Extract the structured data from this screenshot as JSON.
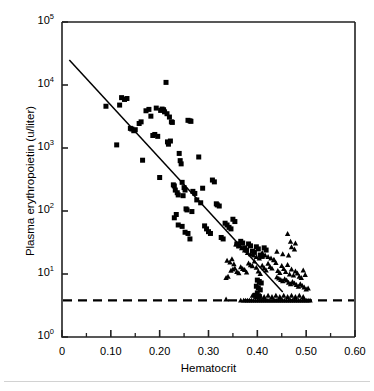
{
  "chart_data": {
    "type": "scatter",
    "title": "",
    "xlabel": "Hematocrit",
    "ylabel": "Plasma erythropoietin (u/liter)",
    "xlim": [
      0,
      0.6
    ],
    "ylim": [
      1,
      100000
    ],
    "yscale": "log",
    "xscale": "linear",
    "grid": false,
    "legend": "none",
    "x_major_ticks": [
      0,
      0.1,
      0.2,
      0.3,
      0.4,
      0.5,
      0.6
    ],
    "x_tick_labels": [
      "0",
      "0.10",
      "0.20",
      "0.30",
      "0.40",
      "0.50",
      "0.60"
    ],
    "x_minor_ticks": [
      0.05,
      0.15,
      0.25,
      0.35,
      0.45,
      0.55
    ],
    "y_major_ticks": [
      1,
      10,
      100,
      1000,
      10000,
      100000
    ],
    "y_tick_labels": [
      {
        "mantissa": "10",
        "exponent": "0"
      },
      {
        "mantissa": "10",
        "exponent": "1"
      },
      {
        "mantissa": "10",
        "exponent": "2"
      },
      {
        "mantissa": "10",
        "exponent": "3"
      },
      {
        "mantissa": "10",
        "exponent": "4"
      },
      {
        "mantissa": "10",
        "exponent": "5"
      }
    ],
    "annotations": [
      {
        "name": "detection-limit-line",
        "type": "hline",
        "y": 3.8,
        "style": "dashed"
      },
      {
        "name": "regression-line",
        "type": "line",
        "style": "solid",
        "x0": 0.015,
        "y0": 25000,
        "x1": 0.452,
        "y1": 5.2
      }
    ],
    "series": [
      {
        "name": "anemic-patients",
        "marker": "square",
        "color": "#000000",
        "points": [
          [
            0.09,
            4600
          ],
          [
            0.112,
            1120
          ],
          [
            0.118,
            4800
          ],
          [
            0.122,
            6300
          ],
          [
            0.128,
            5900
          ],
          [
            0.133,
            6100
          ],
          [
            0.14,
            2050
          ],
          [
            0.143,
            2000
          ],
          [
            0.147,
            1880
          ],
          [
            0.15,
            1950
          ],
          [
            0.158,
            2450
          ],
          [
            0.162,
            2600
          ],
          [
            0.165,
            640
          ],
          [
            0.172,
            3900
          ],
          [
            0.178,
            4100
          ],
          [
            0.182,
            3200
          ],
          [
            0.186,
            1580
          ],
          [
            0.19,
            1640
          ],
          [
            0.193,
            4300
          ],
          [
            0.196,
            1530
          ],
          [
            0.2,
            340
          ],
          [
            0.202,
            3950
          ],
          [
            0.205,
            4150
          ],
          [
            0.208,
            4050
          ],
          [
            0.21,
            3750
          ],
          [
            0.213,
            11000
          ],
          [
            0.215,
            3500
          ],
          [
            0.216,
            1250
          ],
          [
            0.218,
            1150
          ],
          [
            0.22,
            3100
          ],
          [
            0.222,
            1290
          ],
          [
            0.224,
            2600
          ],
          [
            0.226,
            2550
          ],
          [
            0.228,
            260
          ],
          [
            0.23,
            250
          ],
          [
            0.232,
            215
          ],
          [
            0.234,
            88
          ],
          [
            0.236,
            195
          ],
          [
            0.238,
            180
          ],
          [
            0.24,
            820
          ],
          [
            0.242,
            630
          ],
          [
            0.244,
            560
          ],
          [
            0.246,
            285
          ],
          [
            0.248,
            175
          ],
          [
            0.25,
            235
          ],
          [
            0.252,
            215
          ],
          [
            0.254,
            108
          ],
          [
            0.256,
            104
          ],
          [
            0.258,
            2750
          ],
          [
            0.262,
            2700
          ],
          [
            0.264,
            2650
          ],
          [
            0.266,
            98
          ],
          [
            0.23,
            78
          ],
          [
            0.238,
            60
          ],
          [
            0.246,
            57
          ],
          [
            0.252,
            46
          ],
          [
            0.258,
            44
          ],
          [
            0.262,
            36
          ],
          [
            0.268,
            205
          ],
          [
            0.272,
            190
          ],
          [
            0.276,
            150
          ],
          [
            0.28,
            720
          ],
          [
            0.284,
            135
          ],
          [
            0.288,
            230
          ],
          [
            0.292,
            58
          ],
          [
            0.296,
            52
          ],
          [
            0.3,
            47
          ],
          [
            0.304,
            44
          ],
          [
            0.308,
            310
          ],
          [
            0.312,
            290
          ],
          [
            0.316,
            130
          ],
          [
            0.318,
            125
          ],
          [
            0.322,
            120
          ],
          [
            0.326,
            38
          ],
          [
            0.33,
            36
          ],
          [
            0.334,
            64
          ],
          [
            0.338,
            60
          ],
          [
            0.342,
            55
          ],
          [
            0.346,
            52
          ],
          [
            0.35,
            74
          ],
          [
            0.354,
            68
          ],
          [
            0.358,
            30
          ],
          [
            0.362,
            28
          ],
          [
            0.366,
            33
          ],
          [
            0.37,
            31
          ],
          [
            0.374,
            26
          ],
          [
            0.378,
            24
          ],
          [
            0.382,
            30
          ],
          [
            0.386,
            28
          ],
          [
            0.39,
            23
          ],
          [
            0.394,
            22
          ],
          [
            0.398,
            27
          ],
          [
            0.402,
            25
          ],
          [
            0.406,
            20
          ],
          [
            0.41,
            19
          ],
          [
            0.414,
            26
          ],
          [
            0.418,
            24
          ],
          [
            0.4,
            8.0
          ],
          [
            0.404,
            7.6
          ],
          [
            0.408,
            7.2
          ],
          [
            0.398,
            6.4
          ],
          [
            0.402,
            6.0
          ],
          [
            0.406,
            5.6
          ],
          [
            0.4,
            5.0
          ],
          [
            0.396,
            4.6
          ],
          [
            0.404,
            4.4
          ]
        ]
      },
      {
        "name": "non-anemic-patients",
        "marker": "triangle",
        "color": "#000000",
        "points": [
          [
            0.338,
            16.5
          ],
          [
            0.344,
            15.5
          ],
          [
            0.348,
            17.5
          ],
          [
            0.352,
            14.5
          ],
          [
            0.336,
            8.8
          ],
          [
            0.34,
            9.2
          ],
          [
            0.346,
            11.5
          ],
          [
            0.35,
            12.0
          ],
          [
            0.354,
            12.5
          ],
          [
            0.358,
            11.0
          ],
          [
            0.362,
            10.5
          ],
          [
            0.366,
            13.0
          ],
          [
            0.37,
            12.2
          ],
          [
            0.374,
            11.8
          ],
          [
            0.378,
            10.8
          ],
          [
            0.382,
            15.0
          ],
          [
            0.386,
            14.0
          ],
          [
            0.39,
            13.5
          ],
          [
            0.394,
            16.0
          ],
          [
            0.398,
            12.8
          ],
          [
            0.402,
            11.2
          ],
          [
            0.406,
            10.2
          ],
          [
            0.41,
            13.8
          ],
          [
            0.414,
            12.6
          ],
          [
            0.418,
            11.6
          ],
          [
            0.422,
            14.8
          ],
          [
            0.426,
            13.2
          ],
          [
            0.43,
            12.4
          ],
          [
            0.434,
            16.8
          ],
          [
            0.438,
            15.2
          ],
          [
            0.442,
            11.4
          ],
          [
            0.446,
            10.6
          ],
          [
            0.45,
            13.6
          ],
          [
            0.454,
            12.2
          ],
          [
            0.458,
            11.0
          ],
          [
            0.462,
            14.2
          ],
          [
            0.466,
            10.0
          ],
          [
            0.47,
            12.0
          ],
          [
            0.474,
            9.6
          ],
          [
            0.478,
            11.2
          ],
          [
            0.482,
            10.4
          ],
          [
            0.486,
            9.2
          ],
          [
            0.49,
            8.8
          ],
          [
            0.494,
            11.6
          ],
          [
            0.498,
            9.8
          ],
          [
            0.44,
            23
          ],
          [
            0.452,
            21
          ],
          [
            0.464,
            20
          ],
          [
            0.47,
            27
          ],
          [
            0.476,
            25
          ],
          [
            0.462,
            44
          ],
          [
            0.468,
            33
          ],
          [
            0.478,
            31
          ],
          [
            0.356,
            30
          ],
          [
            0.362,
            28
          ],
          [
            0.368,
            26
          ],
          [
            0.374,
            24
          ],
          [
            0.38,
            22
          ],
          [
            0.386,
            21
          ],
          [
            0.392,
            20
          ],
          [
            0.398,
            19
          ],
          [
            0.404,
            18
          ],
          [
            0.41,
            22
          ],
          [
            0.416,
            20
          ],
          [
            0.422,
            19
          ],
          [
            0.428,
            18
          ],
          [
            0.434,
            17
          ],
          [
            0.44,
            9.0
          ],
          [
            0.444,
            8.6
          ],
          [
            0.448,
            8.2
          ],
          [
            0.452,
            7.8
          ],
          [
            0.456,
            8.4
          ],
          [
            0.46,
            8.0
          ],
          [
            0.464,
            7.4
          ],
          [
            0.468,
            7.0
          ],
          [
            0.472,
            7.6
          ],
          [
            0.476,
            7.2
          ],
          [
            0.48,
            6.8
          ],
          [
            0.484,
            6.4
          ],
          [
            0.488,
            7.0
          ],
          [
            0.492,
            6.6
          ],
          [
            0.496,
            6.2
          ],
          [
            0.5,
            5.8
          ],
          [
            0.504,
            6.0
          ],
          [
            0.336,
            4.0
          ],
          [
            0.366,
            3.85
          ],
          [
            0.372,
            3.85
          ],
          [
            0.376,
            3.85
          ],
          [
            0.38,
            3.85
          ],
          [
            0.384,
            3.85
          ],
          [
            0.388,
            3.85
          ],
          [
            0.392,
            3.85
          ],
          [
            0.396,
            3.85
          ],
          [
            0.4,
            3.85
          ],
          [
            0.404,
            3.85
          ],
          [
            0.408,
            3.85
          ],
          [
            0.412,
            3.85
          ],
          [
            0.416,
            3.85
          ],
          [
            0.42,
            3.85
          ],
          [
            0.424,
            3.85
          ],
          [
            0.428,
            3.85
          ],
          [
            0.432,
            3.85
          ],
          [
            0.436,
            3.85
          ],
          [
            0.44,
            3.85
          ],
          [
            0.444,
            3.85
          ],
          [
            0.448,
            3.85
          ],
          [
            0.452,
            3.85
          ],
          [
            0.456,
            3.85
          ],
          [
            0.46,
            3.85
          ],
          [
            0.464,
            3.85
          ],
          [
            0.468,
            3.85
          ],
          [
            0.472,
            3.85
          ],
          [
            0.476,
            3.85
          ],
          [
            0.48,
            3.85
          ],
          [
            0.484,
            3.85
          ],
          [
            0.488,
            3.85
          ],
          [
            0.492,
            3.85
          ],
          [
            0.496,
            3.85
          ],
          [
            0.5,
            3.85
          ],
          [
            0.504,
            3.85
          ],
          [
            0.508,
            3.85
          ],
          [
            0.39,
            4.6
          ],
          [
            0.398,
            4.4
          ],
          [
            0.406,
            4.6
          ],
          [
            0.414,
            4.4
          ],
          [
            0.422,
            4.6
          ],
          [
            0.43,
            4.4
          ],
          [
            0.438,
            4.6
          ],
          [
            0.446,
            4.4
          ],
          [
            0.454,
            4.6
          ],
          [
            0.462,
            4.4
          ],
          [
            0.47,
            4.6
          ],
          [
            0.478,
            4.4
          ],
          [
            0.486,
            4.6
          ],
          [
            0.494,
            4.4
          ]
        ]
      }
    ]
  }
}
